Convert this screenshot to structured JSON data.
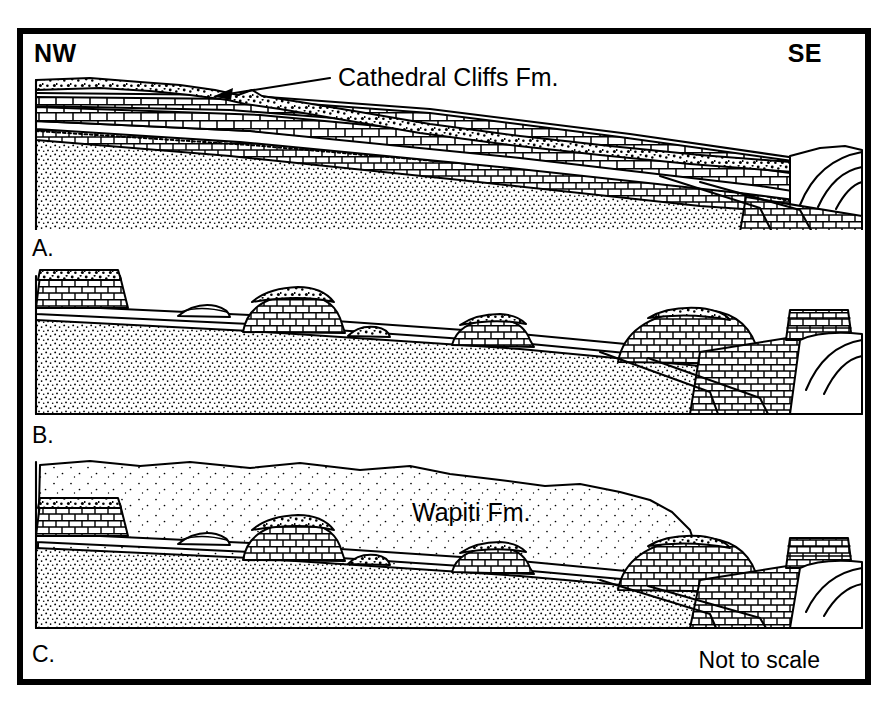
{
  "figure": {
    "title_note": "Not to scale",
    "orientation": {
      "left_label": "NW",
      "right_label": "SE"
    },
    "panels": [
      {
        "id": "A",
        "label": "A.",
        "annotation": "Cathedral Cliffs Fm.",
        "description": "Pre-erosion stratigraphy: volcaniclastic conglomerate sheet over interbedded carbonate and clastic units, truncated southeast against a thrust-fold nose."
      },
      {
        "id": "B",
        "label": "B.",
        "annotation": "",
        "description": "Erosional stage: isolated buttes and mesas of resistant cap rock remain on the beveled surface."
      },
      {
        "id": "C",
        "label": "C.",
        "annotation": "Wapiti Fm.",
        "description": "Burial stage: younger fine clastic formation onlaps and buries the erosional remnants."
      }
    ],
    "patterns": {
      "conglomerate": "coarse-stipple",
      "limestone": "brick-pattern",
      "sandstone": "fine-stipple",
      "mudstone": "sparse-dot"
    },
    "colors": {
      "ink": "#000000",
      "paper": "#ffffff"
    },
    "arrows": [
      {
        "target": "Cathedral Cliffs Fm.",
        "points_to": "conglomerate-sheet"
      }
    ]
  }
}
